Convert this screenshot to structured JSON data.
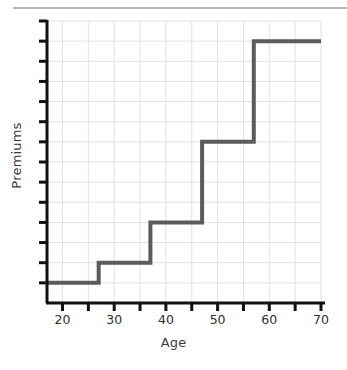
{
  "divider": {
    "name": "top-rule"
  },
  "chart_data": {
    "type": "line",
    "subtype": "step",
    "title": "",
    "xlabel": "Age",
    "ylabel": "Premiums",
    "xlim": [
      17,
      70
    ],
    "ylim": [
      0,
      14
    ],
    "grid": true,
    "legend": null,
    "x_ticks": [
      20,
      25,
      30,
      35,
      40,
      45,
      50,
      55,
      60,
      65,
      70
    ],
    "x_tick_labels": [
      "20",
      "",
      "30",
      "",
      "40",
      "",
      "50",
      "",
      "60",
      "",
      "70"
    ],
    "x_labeled_ticks": [
      {
        "value": 20,
        "label": "20"
      },
      {
        "value": 30,
        "label": "30"
      },
      {
        "value": 40,
        "label": "40"
      },
      {
        "value": 50,
        "label": "50"
      },
      {
        "value": 60,
        "label": "60"
      },
      {
        "value": 70,
        "label": "70"
      }
    ],
    "y_ticks": [
      1,
      2,
      3,
      4,
      5,
      6,
      7,
      8,
      9,
      10,
      11,
      12,
      13,
      14
    ],
    "y_tick_labels": [],
    "series": [
      {
        "name": "Premiums by age",
        "color": "#5c5c5c",
        "line_width": 4,
        "step_type": "post",
        "x": [
          17,
          27,
          37,
          47,
          57,
          70
        ],
        "y": [
          1,
          2,
          4,
          8,
          13,
          13
        ],
        "points": [
          {
            "age": 17,
            "premium": 1
          },
          {
            "age": 27,
            "premium": 2
          },
          {
            "age": 37,
            "premium": 4
          },
          {
            "age": 47,
            "premium": 8
          },
          {
            "age": 57,
            "premium": 13
          },
          {
            "age": 70,
            "premium": 13
          }
        ]
      }
    ],
    "colors": {
      "line": "#5c5c5c",
      "axis": "#111111",
      "grid": "#e2e2e6",
      "text": "#2e2e2e",
      "divider": "#b9b9b9",
      "background": "#ffffff"
    }
  }
}
